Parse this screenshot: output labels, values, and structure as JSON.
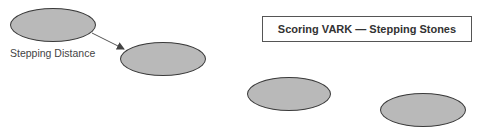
{
  "title": "Scoring VARK — Stepping Stones",
  "label": "Stepping Distance",
  "colors": {
    "stone_fill": "#b9b9b9",
    "stone_stroke": "#3a3a3a",
    "arrow": "#555555"
  },
  "stones": [
    {
      "id": 1,
      "x": 10,
      "y": 8,
      "w": 86,
      "h": 34
    },
    {
      "id": 2,
      "x": 120,
      "y": 42,
      "w": 86,
      "h": 34
    },
    {
      "id": 3,
      "x": 247,
      "y": 77,
      "w": 84,
      "h": 34
    },
    {
      "id": 4,
      "x": 380,
      "y": 93,
      "w": 86,
      "h": 34
    }
  ]
}
